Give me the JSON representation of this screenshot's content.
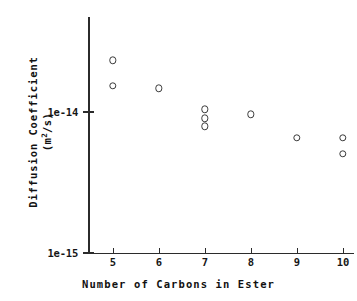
{
  "chart_data": {
    "type": "scatter",
    "title": "",
    "xlabel": "Number of Carbons in Ester",
    "ylabel": "Diffusion Coefficient",
    "ylabel_units": "(m2/s)",
    "yscale": "log",
    "xscale": "linear",
    "grid": false,
    "legend": null,
    "xlim": [
      4.3,
      10.8
    ],
    "ylim": [
      1e-15,
      3.3e-14
    ],
    "xticks": [
      5,
      6,
      7,
      8,
      9,
      10
    ],
    "xtick_labels": [
      "5",
      "6",
      "7",
      "8",
      "9",
      "10"
    ],
    "yticks": [
      1e-15,
      1e-14
    ],
    "ytick_labels": [
      "1e-15",
      "1e-14"
    ],
    "marker": "open-circle",
    "marker_color": "#3a3a3a",
    "points": [
      {
        "x": 5,
        "y": 2.3e-14
      },
      {
        "x": 5,
        "y": 1.52e-14
      },
      {
        "x": 6,
        "y": 1.45e-14
      },
      {
        "x": 7,
        "y": 1.03e-14
      },
      {
        "x": 7,
        "y": 8.9e-15
      },
      {
        "x": 7,
        "y": 7.8e-15
      },
      {
        "x": 8,
        "y": 9.5e-15
      },
      {
        "x": 9,
        "y": 6.5e-15
      },
      {
        "x": 10,
        "y": 6.5e-15
      },
      {
        "x": 10,
        "y": 5e-15
      }
    ]
  },
  "axis": {
    "x_title": "Number of Carbons in Ester",
    "y_title_main": "Diffusion Coefficient",
    "y_title_unit_pre": "(m",
    "y_title_unit_sup": "2",
    "y_title_unit_post": "/s)",
    "ytick_top_label": "1e-14",
    "ytick_bottom_label": "1e-15",
    "xtick_labels": [
      "5",
      "6",
      "7",
      "8",
      "9",
      "10"
    ]
  }
}
